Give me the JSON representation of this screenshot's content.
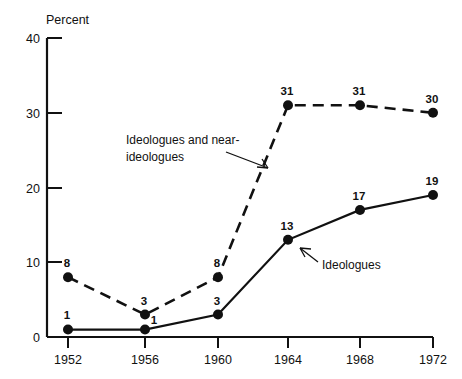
{
  "chart_data": {
    "type": "line",
    "title": "",
    "xlabel": "",
    "ylabel": "Percent",
    "categories": [
      "1952",
      "1956",
      "1960",
      "1964",
      "1968",
      "1972"
    ],
    "x": [
      1952,
      1956,
      1960,
      1964,
      1968,
      1972
    ],
    "ylim": [
      0,
      40
    ],
    "xlim": [
      1952,
      1972
    ],
    "yticks": [
      "0",
      "10",
      "20",
      "30",
      "40"
    ],
    "ytick_values": [
      0,
      10,
      20,
      30,
      40
    ],
    "grid": false,
    "legend_position": "inline-annotations",
    "series": [
      {
        "name": "Ideologues and near-ideologues",
        "style": "dashed",
        "values": [
          8,
          3,
          8,
          31,
          31,
          30
        ],
        "labels": [
          "8",
          "3",
          "8",
          "31",
          "31",
          "30"
        ]
      },
      {
        "name": "Ideologues",
        "style": "solid",
        "values": [
          1,
          1,
          3,
          13,
          17,
          19
        ],
        "labels": [
          "1",
          "1",
          "3",
          "13",
          "17",
          "19"
        ]
      }
    ],
    "annotations": [
      {
        "name": "ideologues-and-near-ideologues-label",
        "text_line1": "Ideologues and near-",
        "text_line2": "ideologues",
        "points_to_series": "Ideologues and near-ideologues"
      },
      {
        "name": "ideologues-label",
        "text_line1": "Ideologues",
        "text_line2": "",
        "points_to_series": "Ideologues"
      }
    ],
    "colors": {
      "ink": "#111111",
      "background": "#ffffff"
    }
  },
  "axis": {
    "y_title": "Percent",
    "y_ticks": [
      "40",
      "30",
      "20",
      "10",
      "0"
    ],
    "x_ticks": [
      "1952",
      "1956",
      "1960",
      "1964",
      "1968",
      "1972"
    ]
  },
  "annotations": {
    "near_line1": "Ideologues and near-",
    "near_line2": "ideologues",
    "ideologues": "Ideologues"
  },
  "point_labels": {
    "dashed": [
      "8",
      "3",
      "8",
      "31",
      "31",
      "30"
    ],
    "solid": [
      "1",
      "1",
      "3",
      "13",
      "17",
      "19"
    ]
  }
}
